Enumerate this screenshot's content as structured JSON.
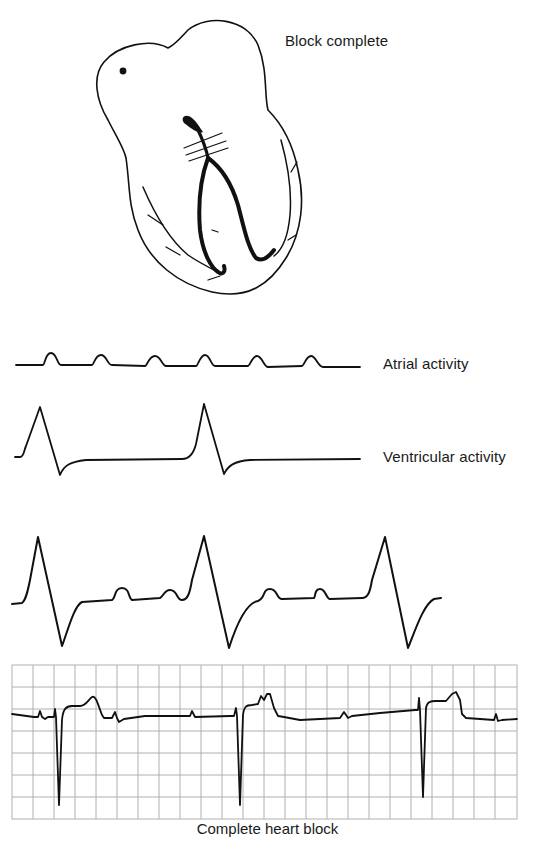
{
  "figure": {
    "heart_label": "Block complete",
    "traces": [
      {
        "id": "atrial",
        "label": "Atrial activity"
      },
      {
        "id": "ventricular",
        "label": "Ventricular activity"
      },
      {
        "id": "combined",
        "label": ""
      }
    ],
    "ecg_strip": {
      "caption": "Complete heart block",
      "grid": {
        "x_start": 12,
        "x_end": 517,
        "y_start": 665,
        "y_end": 819,
        "columns": 24,
        "rows": 7,
        "grid_color": "#b0b0b0"
      }
    },
    "colors": {
      "ink": "#111111",
      "background": "#ffffff",
      "grid": "#b0b0b0"
    }
  }
}
